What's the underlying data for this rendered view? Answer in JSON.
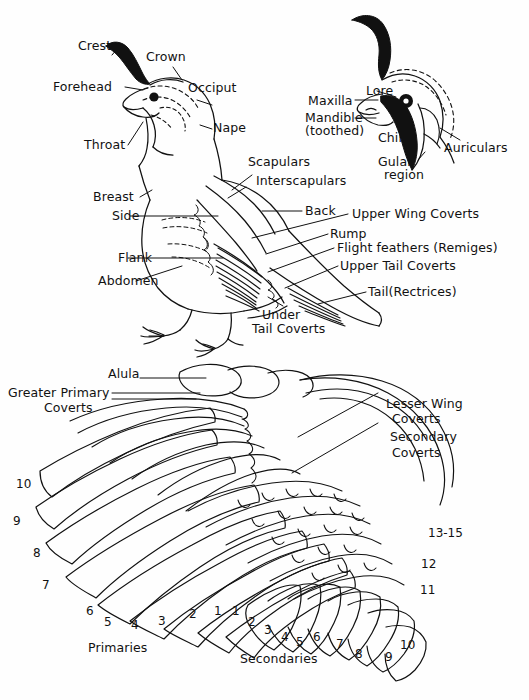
{
  "figure": {
    "background_color": "#fefefe",
    "ink_color": "#111111",
    "panels": [
      "body-and-head-panel",
      "wing-panel"
    ]
  },
  "body_labels": {
    "crest": "Crest",
    "crown": "Crown",
    "forehead": "Forehead",
    "occiput": "Occiput",
    "nape": "Nape",
    "throat": "Throat",
    "breast": "Breast",
    "side": "Side",
    "flank": "Flank",
    "abdomen": "Abdomen",
    "scapulars": "Scapulars",
    "interscapulars": "Interscapulars",
    "back": "Back",
    "rump": "Rump",
    "upper_wing_coverts": "Upper Wing Coverts",
    "flight_feathers": "Flight feathers (Remiges)",
    "upper_tail_coverts": "Upper Tail Coverts",
    "tail_rectrices": "Tail(Rectrices)",
    "under_tail_coverts_line1": "Under",
    "under_tail_coverts_line2": "Tail Coverts"
  },
  "head_detail_labels": {
    "lore": "Lore",
    "maxilla": "Maxilla",
    "mandible_line1": "Mandible",
    "mandible_line2": "(toothed)",
    "chin": "Chin",
    "auriculars": "Auriculars",
    "gular_line1": "Gular",
    "gular_line2": "region"
  },
  "wing_labels": {
    "alula": "Alula",
    "greater_primary_coverts_line1": "Greater Primary",
    "greater_primary_coverts_line2": "Coverts",
    "lesser_wing_coverts_line1": "Lesser Wing",
    "lesser_wing_coverts_line2": "Coverts",
    "secondary_coverts_line1": "Secondary",
    "secondary_coverts_line2": "Coverts",
    "primaries_group": "Primaries",
    "secondaries_group": "Secondaries"
  },
  "primary_numbers": [
    {
      "n": "10",
      "x": 16,
      "y": 477
    },
    {
      "n": "9",
      "x": 13,
      "y": 514
    },
    {
      "n": "8",
      "x": 33,
      "y": 546
    },
    {
      "n": "7",
      "x": 42,
      "y": 578
    },
    {
      "n": "6",
      "x": 86,
      "y": 604
    },
    {
      "n": "5",
      "x": 104,
      "y": 615
    },
    {
      "n": "4",
      "x": 131,
      "y": 618
    },
    {
      "n": "3",
      "x": 158,
      "y": 614
    },
    {
      "n": "2",
      "x": 189,
      "y": 607
    },
    {
      "n": "1",
      "x": 214,
      "y": 604
    }
  ],
  "secondary_numbers": [
    {
      "n": "1",
      "x": 232,
      "y": 604
    },
    {
      "n": "2",
      "x": 248,
      "y": 615
    },
    {
      "n": "3",
      "x": 264,
      "y": 623
    },
    {
      "n": "4",
      "x": 281,
      "y": 630
    },
    {
      "n": "5",
      "x": 296,
      "y": 635
    },
    {
      "n": "6",
      "x": 313,
      "y": 630
    },
    {
      "n": "7",
      "x": 336,
      "y": 637
    },
    {
      "n": "8",
      "x": 355,
      "y": 647
    },
    {
      "n": "9",
      "x": 385,
      "y": 650
    },
    {
      "n": "10",
      "x": 400,
      "y": 638
    },
    {
      "n": "11",
      "x": 420,
      "y": 583
    },
    {
      "n": "12",
      "x": 421,
      "y": 557
    },
    {
      "n": "13-15",
      "x": 428,
      "y": 526
    }
  ]
}
